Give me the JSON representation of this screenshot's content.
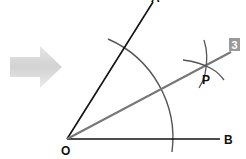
{
  "diagram": {
    "step_badge": "3",
    "labels": {
      "vertex": "O",
      "ray_top": "A",
      "ray_right": "B",
      "intersection": "P"
    },
    "colors": {
      "rays": "#111111",
      "arcs": "#555555",
      "bisector": "#777777",
      "arrow": "#d9d9d9",
      "badge_bg": "#9a9a9a",
      "badge_fg": "#ffffff"
    }
  }
}
